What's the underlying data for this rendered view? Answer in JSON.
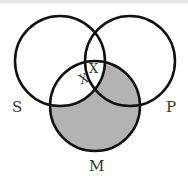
{
  "diagram": {
    "type": "venn",
    "circles": [
      {
        "label": "S",
        "cx": 60,
        "cy": 61,
        "r": 45
      },
      {
        "label": "P",
        "cx": 130,
        "cy": 61,
        "r": 45
      },
      {
        "label": "M",
        "cx": 95,
        "cy": 106,
        "r": 45
      }
    ],
    "shaded_region": "M outside S",
    "shade_color": "#b3b3b3",
    "marks": [
      {
        "text": "X",
        "region": "S∩P∩M (upper)"
      },
      {
        "text": "X",
        "region": "on S boundary in P∩M"
      }
    ],
    "labels": {
      "s": "S",
      "p": "P",
      "m": "M"
    }
  }
}
